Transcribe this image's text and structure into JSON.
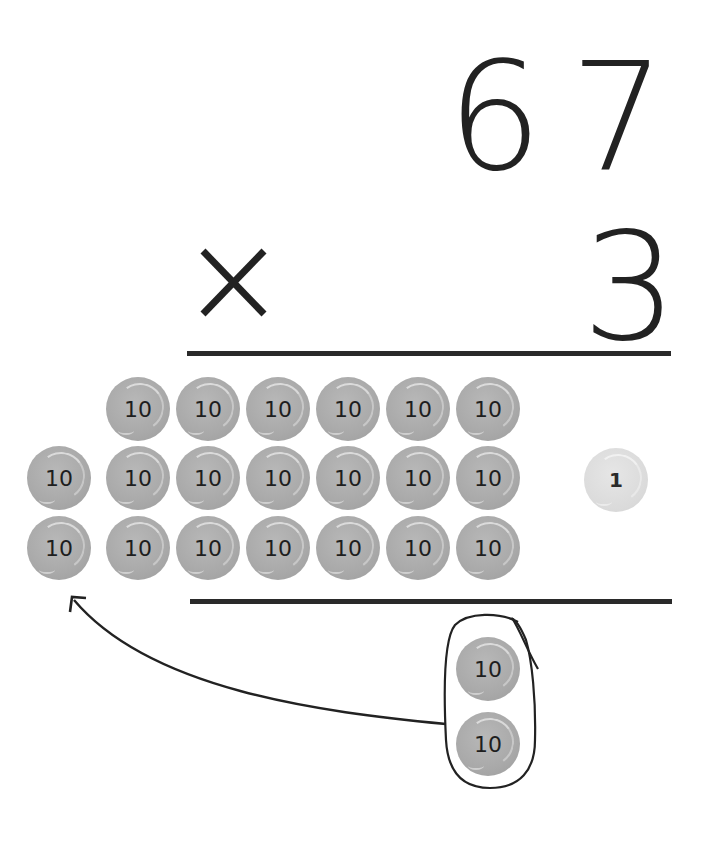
{
  "problem": {
    "multiplicand_tens": "6",
    "multiplicand_ones": "7",
    "operator": "×",
    "multiplier": "3"
  },
  "counters": {
    "ten_label": "10",
    "one_label": "1",
    "rows": [
      {
        "tens_in_place_value": 6,
        "extra_regrouped": 0
      },
      {
        "tens_in_place_value": 6,
        "extra_regrouped": 1
      },
      {
        "tens_in_place_value": 6,
        "extra_regrouped": 1
      }
    ],
    "ones_remaining": 1,
    "regrouped_group": [
      "10",
      "10"
    ]
  },
  "colors": {
    "ink": "#222222",
    "tens_counter": "#a9a9a9",
    "ones_counter": "#dadada",
    "background": "#ffffff"
  }
}
